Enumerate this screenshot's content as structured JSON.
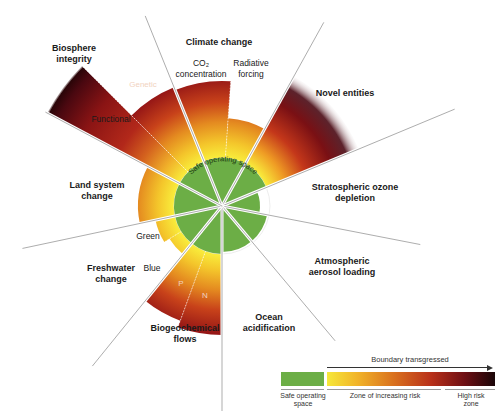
{
  "diagram": {
    "center_label": "Safe operating space",
    "colors": {
      "safe": "#6cae46",
      "risk_start": "#f6e83a",
      "risk_mid": "#d9701e",
      "risk_high": "#6e0f14",
      "high_risk": "#1a0608",
      "divider": "#8a8a8a"
    },
    "boundaries": [
      {
        "id": "climate-change",
        "label": "Climate change",
        "sub": [
          {
            "label": "CO₂ concentration",
            "status": "increasing risk"
          },
          {
            "label": "Radiative forcing",
            "status": "high risk"
          }
        ]
      },
      {
        "id": "novel-entities",
        "label": "Novel entities",
        "status": "high risk (uncertain)"
      },
      {
        "id": "stratospheric-ozone",
        "label": "Stratospheric ozone depletion",
        "status": "safe"
      },
      {
        "id": "atmospheric-aerosol",
        "label": "Atmospheric aerosol loading",
        "status": "safe"
      },
      {
        "id": "ocean-acidification",
        "label": "Ocean acidification",
        "status": "safe"
      },
      {
        "id": "biogeochemical-flows",
        "label": "Biogeochemical flows",
        "sub": [
          {
            "label": "P",
            "status": "high risk"
          },
          {
            "label": "N",
            "status": "high risk"
          }
        ]
      },
      {
        "id": "freshwater-change",
        "label": "Freshwater change",
        "sub": [
          {
            "label": "Green",
            "status": "increasing risk"
          },
          {
            "label": "Blue",
            "status": "increasing risk"
          }
        ]
      },
      {
        "id": "land-system-change",
        "label": "Land system change",
        "status": "increasing risk"
      },
      {
        "id": "biosphere-integrity",
        "label": "Biosphere integrity",
        "sub": [
          {
            "label": "Functional",
            "status": "high risk"
          },
          {
            "label": "Genetic",
            "status": "high risk"
          }
        ]
      }
    ]
  },
  "labels": {
    "climate": "Climate change",
    "co2": "CO₂",
    "co2_2": "concentration",
    "rf1": "Radiative",
    "rf2": "forcing",
    "novel": "Novel entities",
    "ozone1": "Stratospheric ozone",
    "ozone2": "depletion",
    "aerosol1": "Atmospheric",
    "aerosol2": "aerosol loading",
    "ocean1": "Ocean",
    "ocean2": "acidification",
    "bgc1": "Biogeochemical",
    "bgc2": "flows",
    "p": "P",
    "n": "N",
    "fw1": "Freshwater",
    "fw2": "change",
    "green": "Green",
    "blue": "Blue",
    "land1": "Land system",
    "land2": "change",
    "bio1": "Biosphere",
    "bio2": "integrity",
    "functional": "Functional",
    "genetic": "Genetic"
  },
  "legend": {
    "title": "Boundary transgressed",
    "safe": "Safe operating",
    "safe2": "space",
    "zone": "Zone of increasing risk",
    "high": "High risk",
    "high2": "zone"
  }
}
